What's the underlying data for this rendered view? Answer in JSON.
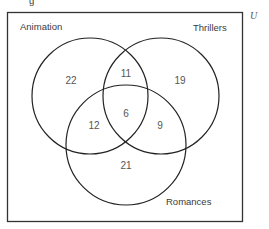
{
  "diagram": {
    "type": "venn-3",
    "universe_label": "U",
    "top_cropped_glyph": "g",
    "sets": [
      {
        "name": "Animation",
        "label": "Animation"
      },
      {
        "name": "Thrillers",
        "label": "Thrillers"
      },
      {
        "name": "Romances",
        "label": "Romances"
      }
    ],
    "regions": {
      "animation_only": "22",
      "thrillers_only": "19",
      "romances_only": "21",
      "animation_thrillers_only": "11",
      "animation_romances_only": "12",
      "thrillers_romances_only": "9",
      "all_three": "6"
    },
    "colors": {
      "stroke": "#222222",
      "text": "#555555",
      "background": "#ffffff"
    }
  }
}
